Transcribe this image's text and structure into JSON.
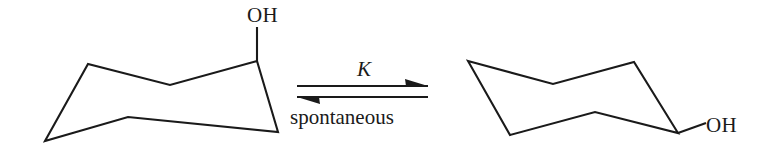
{
  "diagram": {
    "background_color": "#ffffff",
    "stroke_color": "#1a1a1a"
  },
  "reactant": {
    "name": "axial-cyclohexanol-chair",
    "substituent_label": "OH",
    "substituent_orientation": "axial",
    "ring_vertices": "45,141 88,64 170,85 257,61 278,132 128,117",
    "bond_path": "M 257,61 L 257,27"
  },
  "product": {
    "name": "equatorial-cyclohexanol-chair",
    "substituent_label": "OH",
    "substituent_orientation": "equatorial",
    "ring_vertices": "468,61 553,84 634,62 678,133 595,112 510,135",
    "bond_path": "M 678,133 L 706,123"
  },
  "equilibrium_arrow": {
    "name": "equilibrium-arrow",
    "top_label": "K",
    "bottom_label": "spontaneous",
    "top_direction": "right",
    "bottom_direction": "left",
    "top_shaft": "M 297,86 L 428,86",
    "bottom_shaft": "M 297,97 L 428,97",
    "top_barb": "428,86 405,79 406,86",
    "bottom_barb": "297,97 320,104 319,97"
  },
  "labels": {
    "reactant_oh_x": 247,
    "reactant_oh_y": 22,
    "product_oh_x": 706,
    "product_oh_y": 132,
    "k_x": 357,
    "k_y": 76,
    "spontaneous_x": 290,
    "spontaneous_y": 124
  }
}
